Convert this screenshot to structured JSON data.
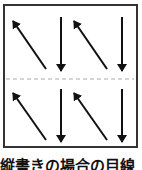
{
  "diagram": {
    "caption": "縦書きの場合の目線",
    "top_row": [
      "diagonal-up-left",
      "down",
      "diagonal-up-left",
      "down"
    ],
    "bottom_row": [
      "diagonal-up-left",
      "down",
      "diagonal-up-left",
      "down"
    ],
    "divider": "dashed"
  }
}
